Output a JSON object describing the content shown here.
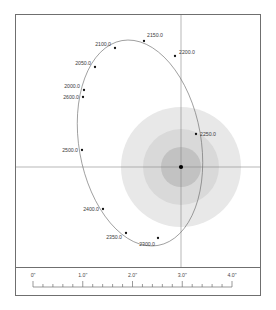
{
  "figure": {
    "type": "visual-binary-orbit",
    "background_color": "#ffffff",
    "frame_color": "#6f6f6f"
  },
  "chart_data": {
    "type": "scatter",
    "title": "",
    "subtitle": "",
    "xlabel": "",
    "ylabel": "",
    "grid": false,
    "legend": null,
    "axis_style": "crosshair",
    "units": "arcseconds",
    "primary_star": {
      "label": "",
      "x": 181,
      "y": 167,
      "color": "#000000",
      "marker": "filled-circle"
    },
    "halos": [
      {
        "name": "outer-halo",
        "radius": 60,
        "color": "#e8e8e8"
      },
      {
        "name": "middle-halo",
        "radius": 38,
        "color": "#d9d9d9"
      },
      {
        "name": "inner-halo",
        "radius": 20,
        "color": "#c2c2c2"
      }
    ],
    "orbit": {
      "name": "orbit-ellipse",
      "color": "#6b6b6b",
      "stroke_width": 0.6,
      "center_x": 140,
      "center_y": 143,
      "semi_major": 104,
      "semi_minor": 61,
      "rotation_deg": -10
    },
    "epoch_points": [
      {
        "label": "2000.0",
        "x": 84,
        "y": 90,
        "label_x": 80,
        "label_y": 88,
        "anchor": "end"
      },
      {
        "label": "2050.0",
        "x": 95,
        "y": 67,
        "label_x": 91,
        "label_y": 65,
        "anchor": "end"
      },
      {
        "label": "2100.0",
        "x": 115,
        "y": 48,
        "label_x": 111,
        "label_y": 46,
        "anchor": "end"
      },
      {
        "label": "2150.0",
        "x": 144,
        "y": 41,
        "label_x": 147,
        "label_y": 37,
        "anchor": "start"
      },
      {
        "label": "2200.0",
        "x": 175,
        "y": 56,
        "label_x": 179,
        "label_y": 54,
        "anchor": "start"
      },
      {
        "label": "2250.0",
        "x": 196,
        "y": 134,
        "label_x": 200,
        "label_y": 136,
        "anchor": "start"
      },
      {
        "label": "2300.0",
        "x": 158,
        "y": 238,
        "label_x": 155,
        "label_y": 246,
        "anchor": "end"
      },
      {
        "label": "2350.0",
        "x": 126,
        "y": 233,
        "label_x": 122,
        "label_y": 239,
        "anchor": "end"
      },
      {
        "label": "2400.0",
        "x": 103,
        "y": 209,
        "label_x": 99,
        "label_y": 211,
        "anchor": "end"
      },
      {
        "label": "2500.0",
        "x": 82,
        "y": 150,
        "label_x": 78,
        "label_y": 152,
        "anchor": "end"
      },
      {
        "label": "2600.0",
        "x": 83,
        "y": 97,
        "label_x": 79,
        "label_y": 99,
        "anchor": "end"
      }
    ],
    "scale_bar": {
      "axis_min": 0.0,
      "axis_max": 4.0,
      "major_interval": 1.0,
      "minor_interval": 0.2,
      "tick_labels": [
        "0\"",
        "1.0\"",
        "2.0\"",
        "3.0\"",
        "4.0\""
      ],
      "tick_values": [
        0.0,
        1.0,
        2.0,
        3.0,
        4.0
      ],
      "line_color": "#6f6f6f"
    },
    "crosshair": {
      "vertical_x": 181,
      "horizontal_y": 167,
      "color": "#888888"
    }
  }
}
